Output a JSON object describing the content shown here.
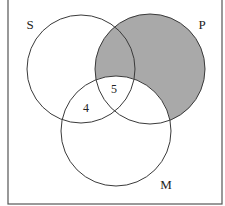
{
  "diagram": {
    "type": "venn",
    "sets": [
      {
        "id": "S",
        "label": "S",
        "cx": 81,
        "cy": 69,
        "r": 54,
        "label_x": 30,
        "label_y": 24
      },
      {
        "id": "P",
        "label": "P",
        "cx": 150,
        "cy": 69,
        "r": 55,
        "label_x": 202,
        "label_y": 24
      },
      {
        "id": "M",
        "label": "M",
        "cx": 116,
        "cy": 131,
        "r": 55,
        "label_x": 166,
        "label_y": 184
      }
    ],
    "region_labels": [
      {
        "region": "S∩P∩M",
        "text": "5",
        "x": 114,
        "y": 89
      },
      {
        "region": "S∩M only",
        "text": "4",
        "x": 86,
        "y": 108
      }
    ],
    "shaded_region": "P minus M",
    "colors": {
      "shade": "#a9a9a9",
      "stroke": "#3a3a3a",
      "frame": "#555555",
      "background": "#ffffff"
    }
  }
}
